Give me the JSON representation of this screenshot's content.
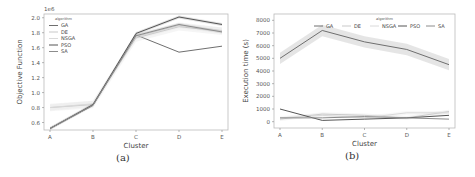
{
  "captions": [
    "(a)",
    "(b)"
  ],
  "chart_data": [
    {
      "type": "line",
      "title": "",
      "xlabel": "Cluster",
      "ylabel": "Objective Function",
      "y_offset_label": "1e6",
      "categories": [
        "A",
        "B",
        "C",
        "D",
        "E"
      ],
      "ylim": [
        0.5,
        2.05
      ],
      "yticks": [
        0.6,
        0.8,
        1.0,
        1.2,
        1.4,
        1.6,
        1.8,
        2.0
      ],
      "grid": false,
      "legend": {
        "title": "algorithm",
        "position": "upper left",
        "entries": [
          "GA",
          "DE",
          "NSGA",
          "PSO",
          "SA"
        ]
      },
      "series": [
        {
          "name": "GA",
          "values": [
            0.52,
            0.83,
            1.77,
            1.54,
            1.62
          ]
        },
        {
          "name": "DE",
          "values": [
            0.8,
            0.84,
            1.73,
            1.88,
            1.82
          ]
        },
        {
          "name": "NSGA",
          "values": [
            0.8,
            0.85,
            1.75,
            1.9,
            1.83
          ]
        },
        {
          "name": "PSO",
          "values": [
            0.52,
            0.84,
            1.79,
            2.01,
            1.91
          ]
        },
        {
          "name": "SA",
          "values": [
            0.52,
            0.83,
            1.76,
            1.91,
            1.81
          ]
        }
      ]
    },
    {
      "type": "line",
      "title": "",
      "xlabel": "Cluster",
      "ylabel": "Execution time (s)",
      "categories": [
        "A",
        "B",
        "C",
        "D",
        "E"
      ],
      "ylim": [
        -500,
        8500
      ],
      "yticks": [
        0,
        1000,
        2000,
        3000,
        4000,
        5000,
        6000,
        7000,
        8000
      ],
      "grid": false,
      "legend": {
        "title": "algorithm",
        "position": "upper right",
        "entries": [
          "GA",
          "DE",
          "NSGA",
          "PSO",
          "SA"
        ]
      },
      "series": [
        {
          "name": "GA",
          "values": [
            5000,
            7200,
            6300,
            5700,
            4500
          ]
        },
        {
          "name": "DE",
          "values": [
            200,
            600,
            500,
            300,
            800
          ]
        },
        {
          "name": "NSGA",
          "values": [
            300,
            500,
            300,
            700,
            700
          ]
        },
        {
          "name": "PSO",
          "values": [
            1000,
            100,
            200,
            300,
            500
          ]
        },
        {
          "name": "SA",
          "values": [
            300,
            300,
            400,
            300,
            200
          ]
        }
      ]
    }
  ]
}
